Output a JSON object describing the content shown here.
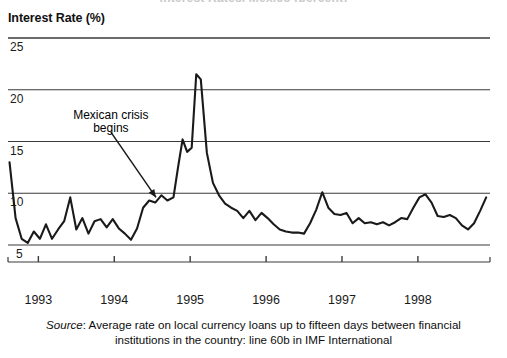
{
  "figure": {
    "clipped_title": "Interest Rates, Mexico (percent)",
    "y_axis_title": "Interest Rate (%)",
    "annotation": {
      "line1": "Mexican crisis",
      "line2": "begins"
    },
    "source_prefix": "Source",
    "source_text": ": Average rate on local currency loans up to fifteen days between financial institutions in the country: line 60b in IMF International",
    "colors": {
      "line": "#1a1a1a",
      "grid": "#3a3a3a",
      "text": "#111111"
    }
  },
  "chart_data": {
    "type": "line",
    "title": "Interest Rate (%)",
    "xlabel": "",
    "ylabel": "Interest Rate (%)",
    "ylim": [
      5,
      25
    ],
    "xlim": [
      1992.6,
      1998.95
    ],
    "grid": true,
    "legend": "none",
    "yticks": [
      5,
      10,
      15,
      20,
      25
    ],
    "xticks": [
      1993,
      1994,
      1995,
      1996,
      1997,
      1998
    ],
    "xtick_labels": [
      "1993",
      "1994",
      "1995",
      "1996",
      "1997",
      "1998"
    ],
    "ytick_labels": [
      "5",
      "10",
      "15",
      "20",
      "25"
    ],
    "annotations": [
      {
        "text": "Mexican crisis begins",
        "x": 1994.55,
        "y": 9.6,
        "text_x": 1993.85,
        "text_y": 17.6,
        "arrow": true
      }
    ],
    "series": [
      {
        "name": "Interest rate",
        "x": [
          1992.62,
          1992.7,
          1992.78,
          1992.86,
          1992.94,
          1993.02,
          1993.1,
          1993.18,
          1993.26,
          1993.34,
          1993.42,
          1993.5,
          1993.58,
          1993.66,
          1993.74,
          1993.82,
          1993.9,
          1993.98,
          1994.06,
          1994.14,
          1994.22,
          1994.3,
          1994.38,
          1994.46,
          1994.54,
          1994.62,
          1994.7,
          1994.78,
          1994.84,
          1994.9,
          1994.96,
          1995.02,
          1995.08,
          1995.14,
          1995.22,
          1995.3,
          1995.38,
          1995.46,
          1995.54,
          1995.62,
          1995.7,
          1995.78,
          1995.86,
          1995.94,
          1996.02,
          1996.1,
          1996.18,
          1996.26,
          1996.34,
          1996.42,
          1996.5,
          1996.58,
          1996.66,
          1996.74,
          1996.82,
          1996.9,
          1996.98,
          1997.06,
          1997.14,
          1997.22,
          1997.3,
          1997.38,
          1997.46,
          1997.54,
          1997.62,
          1997.7,
          1997.78,
          1997.86,
          1997.94,
          1998.02,
          1998.1,
          1998.18,
          1998.26,
          1998.34,
          1998.42,
          1998.5,
          1998.58,
          1998.66,
          1998.74,
          1998.82,
          1998.9
        ],
        "y": [
          13.0,
          7.6,
          5.6,
          5.2,
          6.3,
          5.6,
          7.0,
          5.6,
          6.5,
          7.3,
          9.6,
          6.5,
          7.6,
          6.1,
          7.3,
          7.5,
          6.7,
          7.5,
          6.6,
          6.1,
          5.5,
          6.6,
          8.6,
          9.3,
          9.1,
          9.8,
          9.3,
          9.6,
          12.5,
          15.2,
          14.0,
          14.4,
          21.5,
          21.0,
          13.9,
          11.0,
          9.8,
          9.0,
          8.6,
          8.3,
          7.6,
          8.3,
          7.4,
          8.1,
          7.6,
          7.0,
          6.5,
          6.3,
          6.2,
          6.2,
          6.1,
          7.1,
          8.4,
          10.1,
          8.6,
          8.0,
          7.9,
          8.1,
          7.1,
          7.6,
          7.1,
          7.2,
          7.0,
          7.2,
          6.9,
          7.2,
          7.6,
          7.5,
          8.6,
          9.6,
          9.9,
          9.1,
          7.8,
          7.7,
          7.9,
          7.6,
          6.9,
          6.5,
          7.1,
          8.3,
          9.6
        ]
      }
    ]
  }
}
